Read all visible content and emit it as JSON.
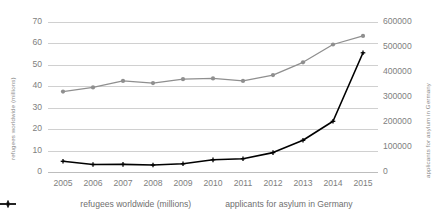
{
  "chart_data": {
    "type": "line",
    "title": "",
    "xlabel": "",
    "categories": [
      2005,
      2006,
      2007,
      2008,
      2009,
      2010,
      2011,
      2012,
      2013,
      2014,
      2015
    ],
    "xtick_labels": [
      "2005",
      "2006",
      "2007",
      "2008",
      "2009",
      "2010",
      "2011",
      "2012",
      "2013",
      "2014",
      "2015"
    ],
    "grid": true,
    "legend_position": "bottom",
    "axes": {
      "left": {
        "label": "refugees worldwide (millions)",
        "ylim": [
          0,
          70
        ],
        "ticks": [
          0,
          10,
          20,
          30,
          40,
          50,
          60,
          70
        ],
        "tick_labels": [
          "0",
          "10",
          "20",
          "30",
          "40",
          "50",
          "60",
          "70"
        ]
      },
      "right": {
        "label": "applicants for asylum in Germany",
        "ylim": [
          0,
          600000
        ],
        "ticks": [
          0,
          100000,
          200000,
          300000,
          400000,
          500000,
          600000
        ],
        "tick_labels": [
          "0",
          "100000",
          "200000",
          "300000",
          "400000",
          "500000",
          "600000"
        ]
      }
    },
    "series": [
      {
        "name": "refugees worldwide (millions)",
        "axis": "left",
        "color": "#8f8f8f",
        "marker": "circle",
        "values": [
          37.5,
          39.5,
          42.5,
          41.5,
          43.3,
          43.7,
          42.5,
          45.2,
          51.2,
          59.5,
          63.5
        ]
      },
      {
        "name": "applicants for asylum in Germany",
        "axis": "right",
        "color": "#000000",
        "marker": "plus",
        "values": [
          42900,
          30100,
          30300,
          28000,
          33000,
          48600,
          53300,
          77600,
          127000,
          202800,
          476600
        ]
      }
    ]
  },
  "legend": {
    "items": [
      {
        "label": "refugees worldwide (millions)",
        "color": "#8f8f8f",
        "marker": "circle"
      },
      {
        "label": "applicants for asylum in Germany",
        "color": "#000000",
        "marker": "plus"
      }
    ]
  }
}
